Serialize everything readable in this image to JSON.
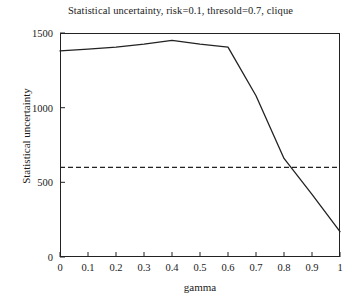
{
  "chart_data": {
    "type": "line",
    "title": "Statistical uncertainty, risk=0.1, thresold=0.7, clique",
    "xlabel": "gamma",
    "ylabel": "Statistical uncertainty",
    "xlim": [
      0,
      1
    ],
    "ylim": [
      0,
      1500
    ],
    "grid": false,
    "legend": null,
    "xticks": [
      0,
      0.1,
      0.2,
      0.3,
      0.4,
      0.5,
      0.6,
      0.7,
      0.8,
      0.9,
      1
    ],
    "xtick_labels": [
      "0",
      "0.1",
      "0.2",
      "0.3",
      "0.4",
      "0.5",
      "0.6",
      "0.7",
      "0.8",
      "0.9",
      "1"
    ],
    "yticks": [
      0,
      500,
      1000,
      1500
    ],
    "ytick_labels": [
      "0",
      "500",
      "1000",
      "1500"
    ],
    "series": [
      {
        "name": "statistical-uncertainty-curve",
        "style": "solid",
        "color": "#222222",
        "x": [
          0,
          0.1,
          0.2,
          0.3,
          0.4,
          0.5,
          0.6,
          0.7,
          0.8,
          0.9,
          1
        ],
        "values": [
          1380,
          1392,
          1405,
          1425,
          1450,
          1425,
          1405,
          1080,
          660,
          420,
          170
        ]
      },
      {
        "name": "reference-threshold-line",
        "style": "dashed",
        "color": "#222222",
        "x": [
          0,
          1
        ],
        "values": [
          600,
          600
        ]
      }
    ]
  }
}
